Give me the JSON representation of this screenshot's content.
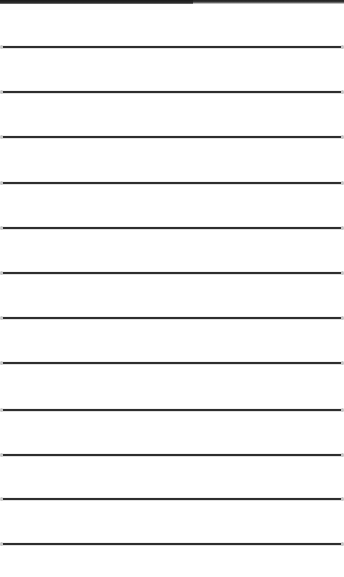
{
  "top_strip": {
    "color": "#222222",
    "segments": [
      {
        "left": 193,
        "width": 75
      },
      {
        "left": 268,
        "width": 76
      }
    ]
  },
  "lines": {
    "color": "#2e2e2e",
    "positions": [
      47,
      92,
      137,
      183,
      228,
      273,
      318,
      363,
      410,
      455,
      499,
      544
    ]
  }
}
